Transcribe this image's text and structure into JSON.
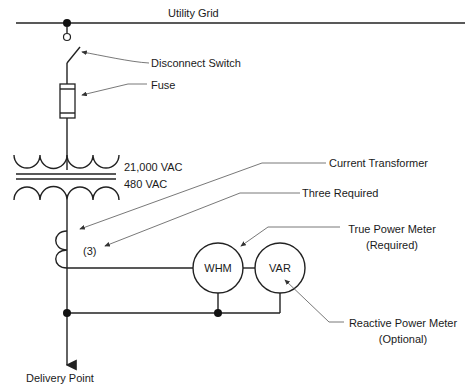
{
  "diagram": {
    "labels": {
      "utility_grid": "Utility Grid",
      "disconnect_switch": "Disconnect Switch",
      "fuse": "Fuse",
      "primary_voltage": "21,000 VAC",
      "secondary_voltage": "480 VAC",
      "current_transformer": "Current Transformer",
      "three_required": "Three Required",
      "ct_count": "(3)",
      "true_power_meter": "True Power Meter",
      "true_power_meter_note": "(Required)",
      "reactive_power_meter": "Reactive Power Meter",
      "reactive_power_meter_note": "(Optional)",
      "delivery_point": "Delivery Point"
    },
    "meters": {
      "whm": "WHM",
      "var": "VAR"
    },
    "colors": {
      "line": "#222222",
      "leader": "#555555",
      "background": "#ffffff"
    }
  }
}
